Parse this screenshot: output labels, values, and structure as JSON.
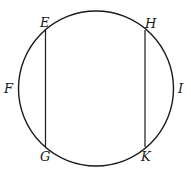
{
  "diagram": {
    "labels": {
      "E": "E",
      "H": "H",
      "F": "F",
      "I": "I",
      "G": "G",
      "K": "K"
    },
    "chords": [
      {
        "name": "EG",
        "from": "E",
        "to": "G"
      },
      {
        "name": "HK",
        "from": "H",
        "to": "K"
      }
    ],
    "stroke_color": "#1a1a1a"
  }
}
